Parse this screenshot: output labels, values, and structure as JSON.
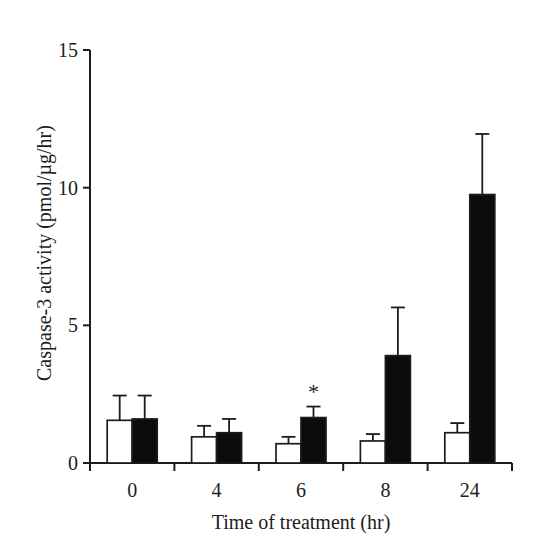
{
  "figure": {
    "background": "#ffffff",
    "ink": "#1c1c1c"
  },
  "chart_data": {
    "type": "bar",
    "title": "",
    "xlabel": "Time of treatment (hr)",
    "ylabel": "Caspase-3 activity (pmol/µg/hr)",
    "categories": [
      "0",
      "4",
      "6",
      "8",
      "24"
    ],
    "ylim": [
      0,
      15
    ],
    "y_ticks": [
      0,
      5,
      10,
      15
    ],
    "grid": false,
    "legend": "none",
    "series": [
      {
        "name": "open",
        "fill": "#ffffff",
        "values": [
          1.55,
          0.95,
          0.7,
          0.8,
          1.1
        ],
        "errors_plus": [
          0.9,
          0.4,
          0.25,
          0.25,
          0.35
        ]
      },
      {
        "name": "filled",
        "fill": "#0c0c0c",
        "values": [
          1.6,
          1.1,
          1.65,
          3.9,
          9.75
        ],
        "errors_plus": [
          0.85,
          0.5,
          0.4,
          1.75,
          2.2
        ]
      }
    ],
    "annotations": [
      {
        "text": "*",
        "series_index": 1,
        "category_index": 2
      }
    ]
  }
}
